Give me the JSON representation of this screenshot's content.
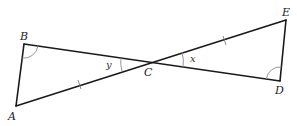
{
  "diagram": {
    "type": "geometry",
    "points": {
      "A": {
        "label": "A"
      },
      "B": {
        "label": "B"
      },
      "C": {
        "label": "C"
      },
      "D": {
        "label": "D"
      },
      "E": {
        "label": "E"
      }
    },
    "segments": [
      "AB",
      "BD",
      "AE",
      "DE"
    ],
    "equal_marks": [
      {
        "segment": "AC",
        "ticks": 1
      },
      {
        "segment": "CE",
        "ticks": 1
      }
    ],
    "angle_marks": [
      {
        "vertex": "B",
        "label": "",
        "note": "marked angle ABC"
      },
      {
        "vertex": "D",
        "label": "",
        "note": "marked angle CDE"
      },
      {
        "vertex": "C",
        "label": "y",
        "note": "angle BCA"
      },
      {
        "vertex": "C",
        "label": "x",
        "note": "angle DCE"
      }
    ],
    "labels": {
      "A": "A",
      "B": "B",
      "C": "C",
      "D": "D",
      "E": "E",
      "x": "x",
      "y": "y"
    }
  }
}
